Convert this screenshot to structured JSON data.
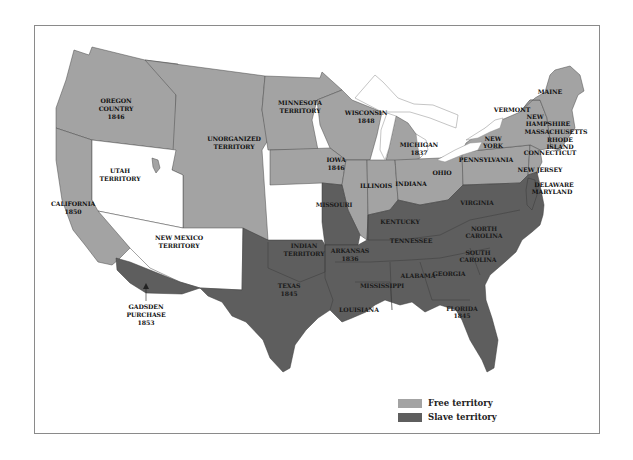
{
  "map": {
    "colors": {
      "free": "#a3a3a3",
      "slave": "#5e5e5e",
      "unaffiliated": "#ffffff",
      "border": "#4a4a4a",
      "frame": "#8a8a8a"
    },
    "labels": {
      "oregon": [
        "OREGON",
        "COUNTRY",
        "1846"
      ],
      "unorganized": [
        "UNORGANIZED",
        "TERRITORY"
      ],
      "minnesota": [
        "MINNESOTA",
        "TERRITORY"
      ],
      "wisconsin": [
        "WISCONSIN",
        "1848"
      ],
      "iowa": [
        "IOWA",
        "1846"
      ],
      "michigan": [
        "MICHIGAN",
        "1837"
      ],
      "illinois": "ILLINOIS",
      "indiana": "INDIANA",
      "ohio": "OHIO",
      "pennsylvania": "PENNSYLVANIA",
      "new_york": [
        "NEW",
        "YORK"
      ],
      "vermont": "VERMONT",
      "maine": "MAINE",
      "new_hampshire": [
        "NEW",
        "HAMPSHIRE"
      ],
      "massachusetts": "MASSACHUSETTS",
      "rhode_island": [
        "RHODE",
        "ISLAND"
      ],
      "connecticut": "CONNECTICUT",
      "new_jersey": "NEW JERSEY",
      "delaware": "DELAWARE",
      "maryland": "MARYLAND",
      "utah": [
        "UTAH",
        "TERRITORY"
      ],
      "california": [
        "CALIFORNIA",
        "1850"
      ],
      "new_mexico": [
        "NEW MEXICO",
        "TERRITORY"
      ],
      "gadsden": [
        "GADSDEN",
        "PURCHASE",
        "1853"
      ],
      "missouri": "MISSOURI",
      "kentucky": "KENTUCKY",
      "virginia": "VIRGINIA",
      "north_carolina": [
        "NORTH",
        "CAROLINA"
      ],
      "tennessee": "TENNESSEE",
      "south_carolina": [
        "SOUTH",
        "CAROLINA"
      ],
      "indian_territory": [
        "INDIAN",
        "TERRITORY"
      ],
      "arkansas": [
        "ARKANSAS",
        "1836"
      ],
      "texas": [
        "TEXAS",
        "1845"
      ],
      "alabama": "ALABAMA",
      "georgia": "GEORGIA",
      "mississippi": "MISSISSIPPI",
      "louisiana": "LOUISIANA",
      "florida": [
        "FLORIDA",
        "1845"
      ]
    }
  },
  "legend": {
    "items": [
      {
        "label": "Free territory",
        "color": "#a3a3a3"
      },
      {
        "label": "Slave territory",
        "color": "#5e5e5e"
      }
    ]
  }
}
